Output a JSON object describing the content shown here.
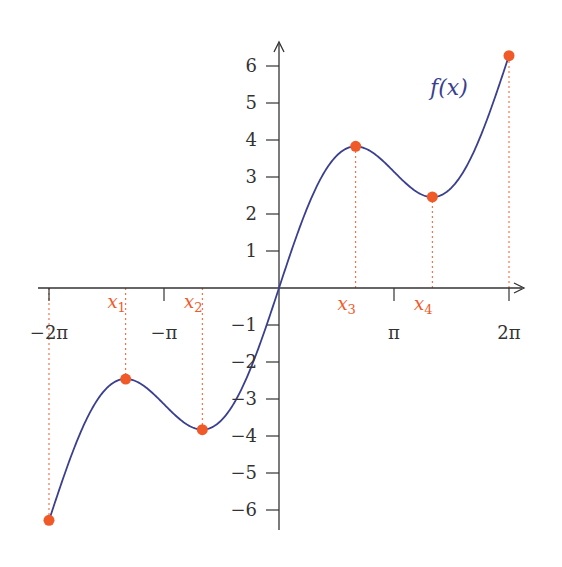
{
  "chart_data": {
    "type": "line",
    "title": "",
    "function_label": "f(x)",
    "function_expr": "x + 2 sin(x)",
    "xlabel": "",
    "ylabel": "",
    "xlim": [
      -6.2832,
      6.2832
    ],
    "ylim": [
      -6.5,
      6.5
    ],
    "grid": false,
    "x_ticks": [
      {
        "value": -6.2832,
        "label": "−2π"
      },
      {
        "value": -3.1416,
        "label": "−π"
      },
      {
        "value": 3.1416,
        "label": "π"
      },
      {
        "value": 6.2832,
        "label": "2π"
      }
    ],
    "y_ticks": [
      {
        "value": 6,
        "label": "6"
      },
      {
        "value": 5,
        "label": "5"
      },
      {
        "value": 4,
        "label": "4"
      },
      {
        "value": 3,
        "label": "3"
      },
      {
        "value": 2,
        "label": "2"
      },
      {
        "value": 1,
        "label": "1"
      },
      {
        "value": -1,
        "label": "−1"
      },
      {
        "value": -2,
        "label": "−2"
      },
      {
        "value": -3,
        "label": "−3"
      },
      {
        "value": -4,
        "label": "−4"
      },
      {
        "value": -5,
        "label": "−5"
      },
      {
        "value": -6,
        "label": "−6"
      }
    ],
    "marked_points": [
      {
        "name": "endpoint-left",
        "x": -6.2832,
        "y": -6.28,
        "label": ""
      },
      {
        "name": "x1",
        "x": -4.1888,
        "y": -2.46,
        "label": "x1"
      },
      {
        "name": "x2",
        "x": -2.0944,
        "y": -3.83,
        "label": "x2"
      },
      {
        "name": "x3",
        "x": 2.0944,
        "y": 3.83,
        "label": "x3"
      },
      {
        "name": "x4",
        "x": 4.1888,
        "y": 2.46,
        "label": "x4"
      },
      {
        "name": "endpoint-right",
        "x": 6.2832,
        "y": 6.28,
        "label": ""
      }
    ],
    "colors": {
      "curve": "#3a3f8f",
      "points": "#f05a28",
      "guides": "#f05a28",
      "axes": "#333333",
      "text": "#333333"
    }
  }
}
